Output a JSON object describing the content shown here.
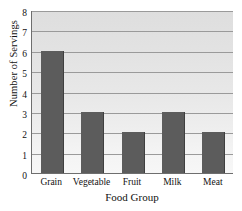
{
  "chart_data": {
    "type": "bar",
    "title": "",
    "xlabel": "Food Group",
    "ylabel": "Number of Servings",
    "categories": [
      "Grain",
      "Vegetable",
      "Fruit",
      "Milk",
      "Meat"
    ],
    "values": [
      6,
      3,
      2,
      3,
      2
    ],
    "ylim": [
      0,
      8
    ],
    "ytick_labels": [
      "0",
      "1",
      "2",
      "3",
      "4",
      "5",
      "6",
      "7",
      "8"
    ],
    "ytick_values": [
      0,
      1,
      2,
      3,
      4,
      5,
      6,
      7,
      8
    ],
    "grid": true,
    "grid_axis": "y",
    "legend": false,
    "series": [
      {
        "name": "Servings",
        "values": [
          6,
          3,
          2,
          3,
          2
        ]
      }
    ]
  },
  "style": {
    "bar_color": "#5c5c5c",
    "bar_edge_color": "#3f3f3f",
    "plot_background_top": "#dedede",
    "plot_background_bottom": "#f7f7f7",
    "gridline_color": "#9a9a9a",
    "axis_color": "#6e6e6e",
    "text_color": "#111111"
  }
}
